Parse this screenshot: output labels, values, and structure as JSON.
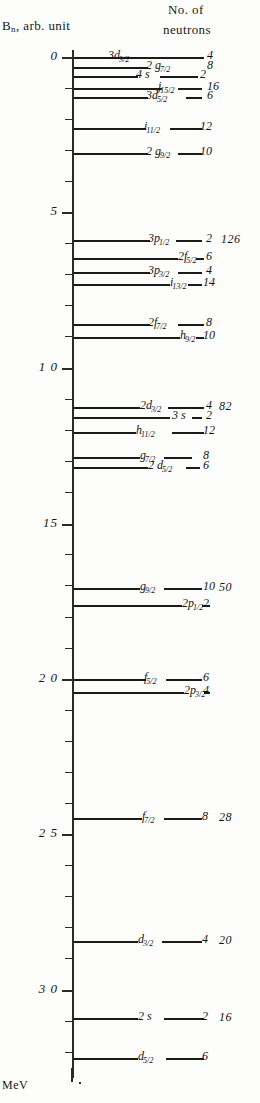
{
  "figure": {
    "axis_title": "B",
    "axis_title_sub": "n",
    "axis_title_rest": ", arb. unit",
    "column_title_line1": "No. of",
    "column_title_line2": "neutrons",
    "unit_label": "MeV",
    "axis_ticks_major": [
      "0",
      "5",
      "1 0",
      "1 0",
      "15",
      "2 0",
      "2 5",
      "3 0"
    ],
    "axis_values": [
      0,
      5,
      10,
      15,
      20,
      25,
      30
    ]
  },
  "chart_data": {
    "type": "levels",
    "xlabel": "",
    "ylabel": "B_n, arb. unit",
    "unit": "MeV",
    "axis_direction": "downward",
    "ylim": [
      0,
      33
    ],
    "yticks": [
      0,
      5,
      10,
      15,
      20,
      25,
      30
    ],
    "ytick_labels": [
      "0",
      "5",
      "10",
      "15",
      "20",
      "25",
      "30"
    ],
    "minor_tick_step": 1,
    "grid": false,
    "legend": false,
    "columns": [
      "orbital",
      "degeneracy",
      "magic_number"
    ],
    "levels": [
      {
        "orbital": "3d",
        "j": "3/2",
        "label_main": "3d",
        "label_sub": "3/2",
        "degeneracy": "4",
        "magic": "",
        "energy": 0.2
      },
      {
        "orbital": "2g",
        "j": "7/2",
        "label_main": "2 g",
        "label_sub": "7/2",
        "degeneracy": "8",
        "magic": "",
        "energy": 0.5
      },
      {
        "orbital": "4s",
        "j": "",
        "label_main": "4 s",
        "label_sub": "",
        "degeneracy": "2",
        "magic": "",
        "energy": 0.8
      },
      {
        "orbital": "j",
        "j": "15/2",
        "label_main": "j",
        "label_sub": "15/2",
        "degeneracy": "16",
        "magic": "",
        "energy": 1.2
      },
      {
        "orbital": "3d",
        "j": "5/2",
        "label_main": "3d",
        "label_sub": "5/2",
        "degeneracy": "6",
        "magic": "",
        "energy": 1.5
      },
      {
        "orbital": "i",
        "j": "11/2",
        "label_main": "i",
        "label_sub": "11/2",
        "degeneracy": "12",
        "magic": "",
        "energy": 2.5
      },
      {
        "orbital": "2g",
        "j": "9/2",
        "label_main": "2 g",
        "label_sub": "9/2",
        "degeneracy": "10",
        "magic": "",
        "energy": 3.3
      },
      {
        "orbital": "3p",
        "j": "1/2",
        "label_main": "3p",
        "label_sub": "1/2",
        "degeneracy": "2",
        "magic": "126",
        "energy": 6.1
      },
      {
        "orbital": "2f",
        "j": "5/2",
        "label_main": "2f",
        "label_sub": "5/2",
        "degeneracy": "6",
        "magic": "",
        "energy": 6.7
      },
      {
        "orbital": "3p",
        "j": "3/2",
        "label_main": "3p",
        "label_sub": "3/2",
        "degeneracy": "4",
        "magic": "",
        "energy": 7.2
      },
      {
        "orbital": "i",
        "j": "13/2",
        "label_main": "i",
        "label_sub": "13/2",
        "degeneracy": "14",
        "magic": "",
        "energy": 7.6
      },
      {
        "orbital": "2f",
        "j": "7/2",
        "label_main": "2f",
        "label_sub": "7/2",
        "degeneracy": "8",
        "magic": "",
        "energy": 8.9
      },
      {
        "orbital": "h",
        "j": "9/2",
        "label_main": "h",
        "label_sub": "9/2",
        "degeneracy": "10",
        "magic": "",
        "energy": 9.3
      },
      {
        "orbital": "2d",
        "j": "3/2",
        "label_main": "2d",
        "label_sub": "3/2",
        "degeneracy": "4",
        "magic": "82",
        "energy": 11.6
      },
      {
        "orbital": "3s",
        "j": "",
        "label_main": "3 s",
        "label_sub": "",
        "degeneracy": "2",
        "magic": "",
        "energy": 11.9
      },
      {
        "orbital": "h",
        "j": "11/2",
        "label_main": "h",
        "label_sub": "11/2",
        "degeneracy": "12",
        "magic": "",
        "energy": 12.4
      },
      {
        "orbital": "g",
        "j": "7/2",
        "label_main": "g",
        "label_sub": "7/2",
        "degeneracy": "8",
        "magic": "",
        "energy": 13.2
      },
      {
        "orbital": "2d",
        "j": "5/2",
        "label_main": "2 d",
        "label_sub": "5/2",
        "degeneracy": "6",
        "magic": "",
        "energy": 13.5
      },
      {
        "orbital": "g",
        "j": "9/2",
        "label_main": "g",
        "label_sub": "9/2",
        "degeneracy": "10",
        "magic": "50",
        "energy": 18.0
      },
      {
        "orbital": "2p",
        "j": "1/2",
        "label_main": "2p",
        "label_sub": "1/2",
        "degeneracy": "2",
        "magic": "",
        "energy": 18.6
      },
      {
        "orbital": "f",
        "j": "5/2",
        "label_main": "f",
        "label_sub": "5/2",
        "degeneracy": "6",
        "magic": "",
        "energy": 20.3
      },
      {
        "orbital": "2p",
        "j": "3/2",
        "label_main": "2p",
        "label_sub": "3/2",
        "degeneracy": "4",
        "magic": "",
        "energy": 20.6
      },
      {
        "orbital": "f",
        "j": "7/2",
        "label_main": "f",
        "label_sub": "7/2",
        "degeneracy": "8",
        "magic": "28",
        "energy": 24.7
      },
      {
        "orbital": "d",
        "j": "3/2",
        "label_main": "d",
        "label_sub": "3/2",
        "degeneracy": "4",
        "magic": "20",
        "energy": 29.0
      },
      {
        "orbital": "2s",
        "j": "",
        "label_main": "2 s",
        "label_sub": "",
        "degeneracy": "2",
        "magic": "16",
        "energy": 31.6
      },
      {
        "orbital": "d",
        "j": "5/2",
        "label_main": "d",
        "label_sub": "5/2",
        "degeneracy": "6",
        "magic": "",
        "energy": 32.6
      }
    ]
  },
  "layout": {
    "levels_px": [
      {
        "y": 57,
        "seg1": [
          74,
          108
        ],
        "orb": [
          108,
          48
        ],
        "seg2": [
          152,
          52
        ],
        "deg": [
          207,
          10
        ],
        "magic": null
      },
      {
        "y": 67,
        "seg1": [
          74,
          74
        ],
        "orb": [
          146,
          56
        ],
        "seg2": [
          190,
          0
        ],
        "deg": [
          207,
          20
        ],
        "magic": null
      },
      {
        "y": 76,
        "seg1": [
          74,
          64
        ],
        "orb": [
          136,
          26
        ],
        "seg2": [
          160,
          38
        ],
        "deg": [
          200,
          24
        ],
        "magic": null
      },
      {
        "y": 88,
        "seg1": [
          74,
          88
        ],
        "orb": [
          158,
          30
        ],
        "seg2": [
          178,
          24
        ],
        "deg": [
          207,
          30
        ],
        "magic": null
      },
      {
        "y": 97,
        "seg1": [
          74,
          74
        ],
        "orb": [
          146,
          40
        ],
        "seg2": [
          186,
          16
        ],
        "deg": [
          207,
          42
        ],
        "magic": null
      },
      {
        "y": 128,
        "seg1": [
          74,
          72
        ],
        "orb": [
          144,
          36
        ],
        "seg2": [
          170,
          32
        ],
        "deg": [
          200,
          52
        ],
        "magic": null
      },
      {
        "y": 153,
        "seg1": [
          74,
          74
        ],
        "orb": [
          146,
          40
        ],
        "seg2": [
          178,
          24
        ],
        "deg": [
          200,
          52
        ],
        "magic": null
      },
      {
        "y": 240,
        "seg1": [
          74,
          76
        ],
        "orb": [
          148,
          36
        ],
        "seg2": [
          176,
          26
        ],
        "deg": [
          206,
          52
        ],
        "magic": [
          221,
          52
        ]
      },
      {
        "y": 258,
        "seg1": [
          74,
          104
        ],
        "orb": [
          178,
          36
        ],
        "seg2": [
          196,
          8
        ],
        "deg": [
          206,
          52
        ],
        "magic": null
      },
      {
        "y": 272,
        "seg1": [
          74,
          76
        ],
        "orb": [
          148,
          36
        ],
        "seg2": [
          178,
          24
        ],
        "deg": [
          206,
          52
        ],
        "magic": null
      },
      {
        "y": 284,
        "seg1": [
          74,
          96
        ],
        "orb": [
          170,
          28
        ],
        "seg2": [
          188,
          14
        ],
        "deg": [
          203,
          52
        ],
        "magic": null
      },
      {
        "y": 324,
        "seg1": [
          74,
          76
        ],
        "orb": [
          148,
          36
        ],
        "seg2": [
          178,
          26
        ],
        "deg": [
          206,
          52
        ],
        "magic": null
      },
      {
        "y": 337,
        "seg1": [
          74,
          106
        ],
        "orb": [
          180,
          28
        ],
        "seg2": [
          196,
          8
        ],
        "deg": [
          203,
          52
        ],
        "magic": null
      },
      {
        "y": 407,
        "seg1": [
          74,
          66
        ],
        "orb": [
          140,
          38
        ],
        "seg2": [
          168,
          36
        ],
        "deg": [
          206,
          52
        ],
        "magic": [
          219,
          52
        ]
      },
      {
        "y": 417,
        "seg1": [
          74,
          96
        ],
        "orb": [
          172,
          22
        ],
        "seg2": [
          192,
          10
        ],
        "deg": [
          206,
          52
        ],
        "magic": null
      },
      {
        "y": 432,
        "seg1": [
          74,
          62
        ],
        "orb": [
          136,
          40
        ],
        "seg2": [
          172,
          32
        ],
        "deg": [
          203,
          52
        ],
        "magic": null
      },
      {
        "y": 457,
        "seg1": [
          74,
          66
        ],
        "orb": [
          140,
          26
        ],
        "seg2": [
          164,
          28
        ],
        "deg": [
          203,
          52
        ],
        "magic": null
      },
      {
        "y": 467,
        "seg1": [
          74,
          74
        ],
        "orb": [
          148,
          42
        ],
        "seg2": [
          186,
          14
        ],
        "deg": [
          203,
          52
        ],
        "magic": null
      },
      {
        "y": 588,
        "seg1": [
          74,
          66
        ],
        "orb": [
          140,
          26
        ],
        "seg2": [
          164,
          38
        ],
        "deg": [
          203,
          52
        ],
        "magic": [
          219,
          52
        ]
      },
      {
        "y": 605,
        "seg1": [
          74,
          108
        ],
        "orb": [
          182,
          26
        ],
        "seg2": [
          202,
          8
        ],
        "deg": [
          203,
          52
        ],
        "magic": null
      },
      {
        "y": 679,
        "seg1": [
          74,
          72
        ],
        "orb": [
          144,
          26
        ],
        "seg2": [
          166,
          36
        ],
        "deg": [
          203,
          52
        ],
        "magic": null
      },
      {
        "y": 692,
        "seg1": [
          74,
          110
        ],
        "orb": [
          184,
          26
        ],
        "seg2": [
          204,
          6
        ],
        "deg": [
          203,
          52
        ],
        "magic": null
      },
      {
        "y": 818,
        "seg1": [
          74,
          68
        ],
        "orb": [
          142,
          26
        ],
        "seg2": [
          164,
          38
        ],
        "deg": [
          202,
          52
        ],
        "magic": [
          219,
          52
        ]
      },
      {
        "y": 941,
        "seg1": [
          74,
          64
        ],
        "orb": [
          138,
          26
        ],
        "seg2": [
          162,
          40
        ],
        "deg": [
          202,
          52
        ],
        "magic": [
          219,
          52
        ]
      },
      {
        "y": 1018,
        "seg1": [
          74,
          64
        ],
        "orb": [
          138,
          28
        ],
        "seg2": [
          164,
          40
        ],
        "deg": [
          202,
          52
        ],
        "magic": [
          219,
          52
        ]
      },
      {
        "y": 1058,
        "seg1": [
          74,
          64
        ],
        "orb": [
          138,
          26
        ],
        "seg2": [
          166,
          38
        ],
        "deg": [
          202,
          52
        ],
        "magic": null
      }
    ],
    "major_ticks_px": [
      {
        "y": 57,
        "label": "0"
      },
      {
        "y": 212,
        "label": "5"
      },
      {
        "y": 368,
        "label": "1 0"
      },
      {
        "y": 524,
        "label": "15"
      },
      {
        "y": 679,
        "label": "2 0"
      },
      {
        "y": 834,
        "label": "2 5"
      },
      {
        "y": 990,
        "label": "3 0"
      }
    ],
    "minor_ticks_px": [
      88,
      119,
      150,
      181,
      243,
      274,
      305,
      336,
      399,
      430,
      461,
      492,
      554,
      585,
      617,
      648,
      710,
      741,
      772,
      803,
      865,
      896,
      927,
      958,
      1021,
      1052
    ]
  }
}
